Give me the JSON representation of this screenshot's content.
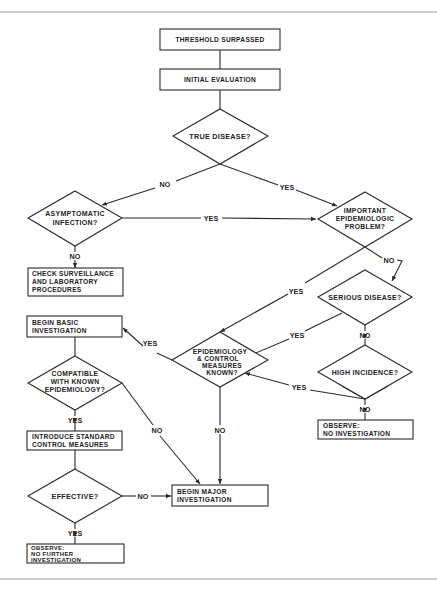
{
  "flowchart": {
    "nodes": {
      "threshold": {
        "type": "process",
        "lines": [
          "THRESHOLD SURPASSED"
        ]
      },
      "initial": {
        "type": "process",
        "lines": [
          "INITIAL EVALUATION"
        ]
      },
      "true_disease": {
        "type": "decision",
        "lines": [
          "TRUE DISEASE?"
        ]
      },
      "asymptomatic": {
        "type": "decision",
        "lines": [
          "ASYMPTOMATIC",
          "INFECTION?"
        ]
      },
      "important": {
        "type": "decision",
        "lines": [
          "IMPORTANT",
          "EPIDEMIOLOGIC",
          "PROBLEM?"
        ]
      },
      "check": {
        "type": "process",
        "lines": [
          "CHECK SURVEILLANCE",
          "AND LABORATORY",
          "PROCEDURES"
        ]
      },
      "serious": {
        "type": "decision",
        "lines": [
          "SERIOUS DISEASE?"
        ]
      },
      "epi_known": {
        "type": "decision",
        "lines": [
          "EPIDEMIOLOGY",
          "& CONTROL",
          "MEASURES",
          "KNOWN?"
        ]
      },
      "high_incidence": {
        "type": "decision",
        "lines": [
          "HIGH INCIDENCE?"
        ]
      },
      "begin_basic": {
        "type": "process",
        "lines": [
          "BEGIN BASIC",
          "INVESTIGATION"
        ]
      },
      "compatible": {
        "type": "decision",
        "lines": [
          "COMPATIBLE",
          "WITH KNOWN",
          "EPIDEMIOLOGY?"
        ]
      },
      "observe_none": {
        "type": "process",
        "lines": [
          "OBSERVE:",
          "NO INVESTIGATION"
        ]
      },
      "introduce": {
        "type": "process",
        "lines": [
          "INTRODUCE STANDARD",
          "CONTROL MEASURES"
        ]
      },
      "effective": {
        "type": "decision",
        "lines": [
          "EFFECTIVE?"
        ]
      },
      "begin_major": {
        "type": "process",
        "lines": [
          "BEGIN MAJOR",
          "INVESTIGATION"
        ]
      },
      "observe_no_further": {
        "type": "process",
        "lines": [
          "OBSERVE:",
          "NO FURTHER",
          "INVESTIGATION"
        ]
      }
    },
    "edges": {
      "true_no": "NO",
      "true_yes": "YES",
      "asym_yes": "YES",
      "asym_no": "NO",
      "imp_no": "NO",
      "imp_yes": "YES",
      "serious_yes": "YES",
      "serious_no": "NO",
      "high_yes": "YES",
      "high_no": "NO",
      "epi_yes": "YES",
      "epi_no": "NO",
      "compat_yes": "YES",
      "compat_no": "NO",
      "eff_no": "NO",
      "eff_yes": "YES"
    }
  }
}
